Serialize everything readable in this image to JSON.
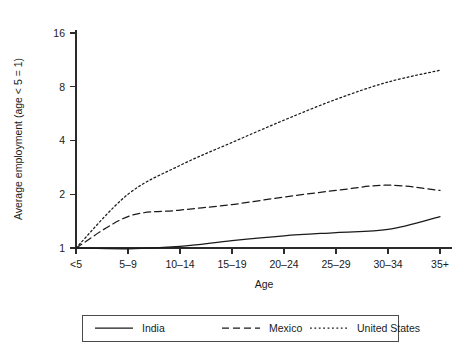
{
  "chart_data": {
    "type": "line",
    "title": "",
    "xlabel": "Age",
    "ylabel": "Average employment (age < 5 = 1)",
    "categories": [
      "<5",
      "5–9",
      "10–14",
      "15–19",
      "20–24",
      "25–29",
      "30–34",
      "35+"
    ],
    "yscale": "log2",
    "yticks": [
      1,
      2,
      4,
      8,
      16
    ],
    "ytick_labels": [
      "1",
      "2",
      "4",
      "8",
      "16"
    ],
    "ylim": [
      0.92,
      18
    ],
    "grid": false,
    "legend_position": "below-plot",
    "series": [
      {
        "name": "India",
        "style": "solid",
        "color": "#1a1a1a",
        "values": [
          1.0,
          0.99,
          1.02,
          1.1,
          1.17,
          1.22,
          1.27,
          1.5
        ]
      },
      {
        "name": "Mexico",
        "style": "dashed",
        "color": "#1a1a1a",
        "values": [
          1.0,
          1.5,
          1.63,
          1.75,
          1.93,
          2.1,
          2.25,
          2.1
        ]
      },
      {
        "name": "United States",
        "style": "dotted",
        "color": "#1a1a1a",
        "values": [
          1.0,
          2.0,
          2.9,
          3.9,
          5.2,
          6.8,
          8.5,
          9.9
        ]
      }
    ]
  },
  "legend": {
    "entries": [
      {
        "label": "India",
        "style": "solid"
      },
      {
        "label": "Mexico",
        "style": "dashed"
      },
      {
        "label": "United States",
        "style": "dotted"
      }
    ]
  }
}
